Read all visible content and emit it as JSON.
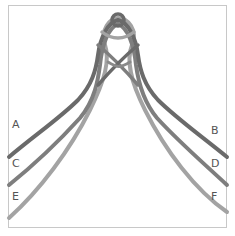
{
  "diagram": {
    "type": "knot-illustration",
    "cords": [
      {
        "left_label": "A",
        "right_label": "B",
        "color": "#6a6a6a"
      },
      {
        "left_label": "C",
        "right_label": "D",
        "color": "#7e7e7e"
      },
      {
        "left_label": "E",
        "right_label": "F",
        "color": "#a3a3a3"
      }
    ],
    "labels": {
      "A": "A",
      "B": "B",
      "C": "C",
      "D": "D",
      "E": "E",
      "F": "F"
    }
  }
}
